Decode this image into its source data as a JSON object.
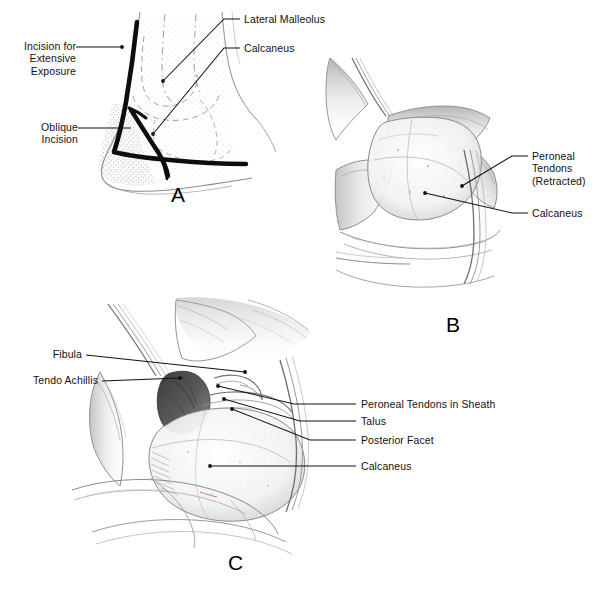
{
  "figure": {
    "panel_count": 3,
    "style": "pencil line drawing, black leader lines",
    "background_color": "#ffffff",
    "ink_color": "#111111",
    "shade_color": "#8d8d8d",
    "dark_shade_color": "#4a4a4a"
  },
  "panels": [
    {
      "id": "A",
      "letter": "A",
      "caption": "Lateral ankle skin incisions",
      "labels": [
        {
          "key": "incision-for-extensive-exposure",
          "text": "Incision for\nExtensive\nExposure",
          "lines": [
            "Incision for",
            "Extensive",
            "Exposure"
          ],
          "align": "right"
        },
        {
          "key": "oblique-incision",
          "text": "Oblique\nIncision",
          "lines": [
            "Oblique",
            "Incision"
          ],
          "align": "right"
        },
        {
          "key": "lateral-malleolus",
          "text": "Lateral Malleolus",
          "lines": [
            "Lateral Malleolus"
          ],
          "align": "left"
        },
        {
          "key": "calcaneus-a",
          "text": "Calcaneus",
          "lines": [
            "Calcaneus"
          ],
          "align": "left"
        }
      ]
    },
    {
      "id": "B",
      "letter": "B",
      "caption": "Exposure with peroneal tendons retracted",
      "labels": [
        {
          "key": "peroneal-tendons-retracted",
          "text": "Peroneal\nTendons\n(Retracted)",
          "lines": [
            "Peroneal",
            "Tendons",
            "(Retracted)"
          ],
          "align": "left"
        },
        {
          "key": "calcaneus-b",
          "text": "Calcaneus",
          "lines": [
            "Calcaneus"
          ],
          "align": "left"
        }
      ]
    },
    {
      "id": "C",
      "letter": "C",
      "caption": "Deep exposure of the posterior facet",
      "labels": [
        {
          "key": "fibula",
          "text": "Fibula",
          "lines": [
            "Fibula"
          ],
          "align": "right"
        },
        {
          "key": "tendo-achillis",
          "text": "Tendo Achillis",
          "lines": [
            "Tendo Achillis"
          ],
          "align": "right"
        },
        {
          "key": "peroneal-tendons-in-sheath",
          "text": "Peroneal Tendons in Sheath",
          "lines": [
            "Peroneal Tendons in Sheath"
          ],
          "align": "left"
        },
        {
          "key": "talus",
          "text": "Talus",
          "lines": [
            "Talus"
          ],
          "align": "left"
        },
        {
          "key": "posterior-facet",
          "text": "Posterior Facet",
          "lines": [
            "Posterior Facet"
          ],
          "align": "left"
        },
        {
          "key": "calcaneus-c",
          "text": "Calcaneus",
          "lines": [
            "Calcaneus"
          ],
          "align": "left"
        }
      ]
    }
  ]
}
